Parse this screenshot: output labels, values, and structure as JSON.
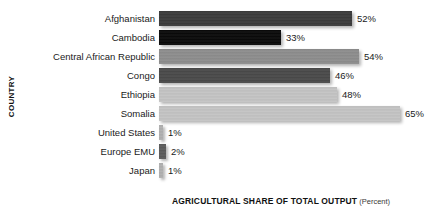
{
  "chart_data": {
    "type": "bar",
    "orientation": "horizontal",
    "title": "",
    "xlabel": "AGRICULTURAL SHARE OF TOTAL OUTPUT",
    "xlabel_unit": "(Percent)",
    "ylabel": "COUNTRY",
    "grid": false,
    "legend": "none",
    "xlim": [
      0,
      70
    ],
    "categories": [
      "Afghanistan",
      "Cambodia",
      "Central African Republic",
      "Congo",
      "Ethiopia",
      "Somalia",
      "United States",
      "Europe EMU",
      "Japan"
    ],
    "values": [
      52,
      33,
      54,
      46,
      48,
      65,
      1,
      2,
      1
    ],
    "value_labels": [
      "52%",
      "33%",
      "54%",
      "46%",
      "48%",
      "65%",
      "1%",
      "2%",
      "1%"
    ],
    "bar_colors": [
      "#3a3a3a",
      "#0a0a0a",
      "#8d8d8d",
      "#4a4a4a",
      "#c4c4c4",
      "#c4c4c4",
      "#b0b0b0",
      "#5a5a5a",
      "#b0b0b0"
    ]
  }
}
